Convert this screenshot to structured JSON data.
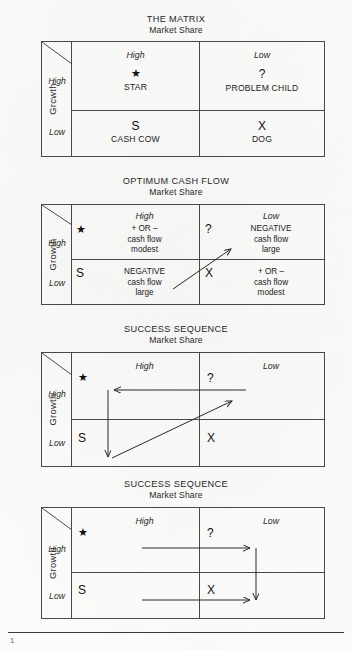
{
  "page": {
    "background_color": "#fdfdfc",
    "ink_color": "#1b1b1b",
    "line_color": "#4a4a4a"
  },
  "diagrams": [
    {
      "id": "the-matrix",
      "title": "THE MATRIX",
      "subtitle": "Market Share",
      "y_axis_label": "Grcwth",
      "row_labels": [
        "High",
        "Low"
      ],
      "column_headers": [
        "High",
        "Low"
      ],
      "cells": [
        {
          "position": "top-left",
          "glyph": "★",
          "name": "STAR",
          "lines": []
        },
        {
          "position": "top-right",
          "glyph": "?",
          "name": "PROBLEM CHILD",
          "lines": []
        },
        {
          "position": "bottom-left",
          "glyph": "S",
          "name": "CASH COW",
          "lines": []
        },
        {
          "position": "bottom-right",
          "glyph": "X",
          "name": "DOG",
          "lines": []
        }
      ],
      "arrows": []
    },
    {
      "id": "optimum-cash-flow",
      "title": "OPTIMUM CASH FLOW",
      "subtitle": "Market Share",
      "y_axis_label": "Growth",
      "row_labels": [
        "High",
        "Low"
      ],
      "column_headers": [
        "High",
        "Low"
      ],
      "cells": [
        {
          "position": "top-left",
          "glyph": "★",
          "name": "",
          "lines": [
            "+ OR –",
            "cash flow",
            "modest"
          ]
        },
        {
          "position": "top-right",
          "glyph": "?",
          "name": "",
          "lines": [
            "NEGATIVE",
            "cash flow",
            "large"
          ]
        },
        {
          "position": "bottom-left",
          "glyph": "S",
          "name": "",
          "lines": [
            "NEGATIVE",
            "cash flow",
            "large"
          ]
        },
        {
          "position": "bottom-right",
          "glyph": "X",
          "name": "",
          "lines": [
            "+ OR –",
            "cash flow",
            "modest"
          ]
        }
      ],
      "arrows": [
        {
          "name": "diagonal-up-right-arrow",
          "direction": "up-right"
        }
      ]
    },
    {
      "id": "success-sequence-1",
      "title": "SUCCESS SEQUENCE",
      "subtitle": "Market Share",
      "y_axis_label": "Growth",
      "row_labels": [
        "High",
        "Low"
      ],
      "column_headers": [
        "High",
        "Low"
      ],
      "cells": [
        {
          "position": "top-left",
          "glyph": "★",
          "name": "",
          "lines": []
        },
        {
          "position": "top-right",
          "glyph": "?",
          "name": "",
          "lines": []
        },
        {
          "position": "bottom-left",
          "glyph": "S",
          "name": "",
          "lines": []
        },
        {
          "position": "bottom-right",
          "glyph": "X",
          "name": "",
          "lines": []
        }
      ],
      "arrows": [
        {
          "name": "horizontal-left-arrow",
          "direction": "left"
        },
        {
          "name": "vertical-down-arrow",
          "direction": "down"
        },
        {
          "name": "diagonal-up-right-arrow",
          "direction": "up-right"
        }
      ]
    },
    {
      "id": "success-sequence-2",
      "title": "SUCCESS SEQUENCE",
      "subtitle": "Market Share",
      "y_axis_label": "Growth",
      "row_labels": [
        "High",
        "Low"
      ],
      "column_headers": [
        "High",
        "Low"
      ],
      "cells": [
        {
          "position": "top-left",
          "glyph": "★",
          "name": "",
          "lines": []
        },
        {
          "position": "top-right",
          "glyph": "?",
          "name": "",
          "lines": []
        },
        {
          "position": "bottom-left",
          "glyph": "S",
          "name": "",
          "lines": []
        },
        {
          "position": "bottom-right",
          "glyph": "X",
          "name": "",
          "lines": []
        }
      ],
      "arrows": [
        {
          "name": "horizontal-right-arrow-top",
          "direction": "right"
        },
        {
          "name": "horizontal-right-arrow-bottom",
          "direction": "right"
        },
        {
          "name": "vertical-down-arrow",
          "direction": "down"
        }
      ]
    }
  ],
  "footer": {
    "mark": "1"
  }
}
